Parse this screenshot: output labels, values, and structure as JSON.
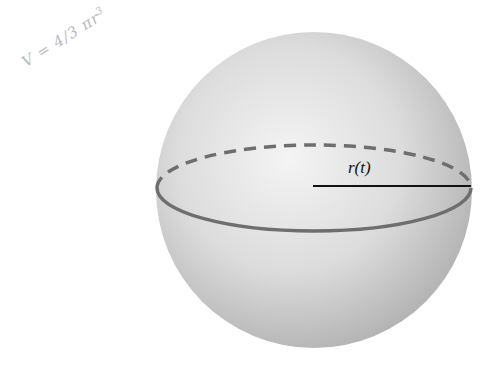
{
  "figure": {
    "type": "sphere-diagram",
    "handwritten_note": {
      "text": "V = 4/3 πr",
      "exponent": "3"
    },
    "radius_label": "r(t)",
    "sphere": {
      "cx": 314,
      "cy": 190,
      "r": 158,
      "fill_light": "#f2f2f2",
      "fill_dark": "#b5b5b5"
    },
    "equator": {
      "cy": 188,
      "rx": 157,
      "ry": 43,
      "stroke": "#6e6e6e",
      "back_style": "dashed",
      "front_style": "solid"
    },
    "radius_line": {
      "x1": 313,
      "x2": 471,
      "y": 186,
      "stroke": "#111111"
    }
  }
}
